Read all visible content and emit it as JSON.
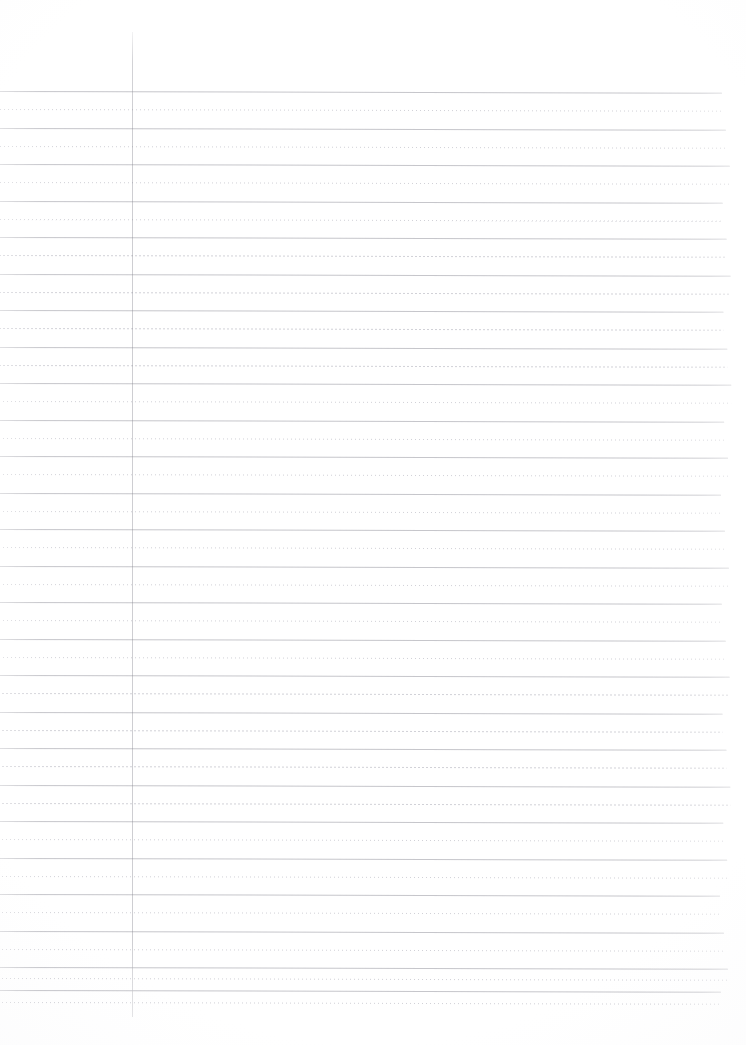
{
  "document": {
    "kind": "scanned-ruled-paper",
    "title": "Blank ruled notebook page",
    "page_width": 746,
    "page_height": 1045,
    "background_color": "#ffffff",
    "content_text": "",
    "is_blank": true
  },
  "colors": {
    "paper": "#ffffff",
    "solid_rule": "#b5b5bd",
    "dotted_rule": "#d9d9df",
    "margin_rule": "#c0c0c8"
  },
  "ruling": {
    "style": "alternating solid and dotted horizontal rules",
    "solid_rule_count": 26,
    "dotted_rule_count": 26,
    "line_spacing_px": 36.5,
    "half_spacing_px": 18.25,
    "first_solid_y": 91,
    "first_dotted_y": 109,
    "rule_left_x": 0,
    "rule_right_x": 727,
    "skew_degrees": 0.13,
    "solid_rules_y": [
      91,
      127.5,
      164,
      200.5,
      237,
      273.5,
      310,
      346.5,
      383,
      419.5,
      456,
      492.5,
      529,
      565.5,
      602,
      638.5,
      675,
      711.5,
      748,
      784.5,
      821,
      857.5,
      894,
      930.5,
      967,
      990
    ],
    "dotted_rules_y": [
      109,
      145.5,
      182,
      218.5,
      255,
      291.5,
      328,
      364.5,
      401,
      437.5,
      474,
      510.5,
      547,
      583.5,
      620,
      656.5,
      693,
      729.5,
      766,
      802.5,
      839,
      875.5,
      912,
      948.5,
      978,
      1002
    ]
  },
  "margin_rule": {
    "orientation": "vertical",
    "x": 132,
    "y_top": 32,
    "y_bottom": 1017,
    "purpose": "left margin guide"
  },
  "regions": {
    "top_margin_label": "top margin",
    "left_margin_label": "left margin",
    "body_label": "writing area",
    "bottom_margin_label": "bottom margin"
  }
}
